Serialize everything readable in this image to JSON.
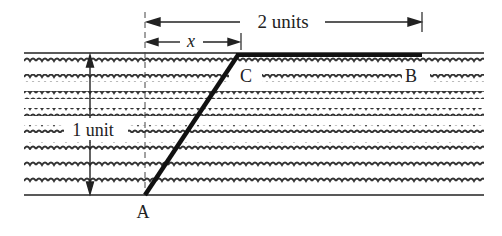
{
  "diagram": {
    "labels": {
      "total_width": "2 units",
      "offset": "x",
      "height": "1 unit",
      "point_a": "A",
      "point_b": "B",
      "point_c": "C"
    },
    "colors": {
      "ink": "#222222",
      "background": "#ffffff"
    },
    "geometry": {
      "top_boundary_y": 53,
      "bottom_boundary_y": 195,
      "wave_rows": 8,
      "dashed_vertical_x": 145,
      "point_a": [
        145,
        195
      ],
      "point_c": [
        238,
        55
      ],
      "point_b": [
        422,
        55
      ]
    }
  }
}
